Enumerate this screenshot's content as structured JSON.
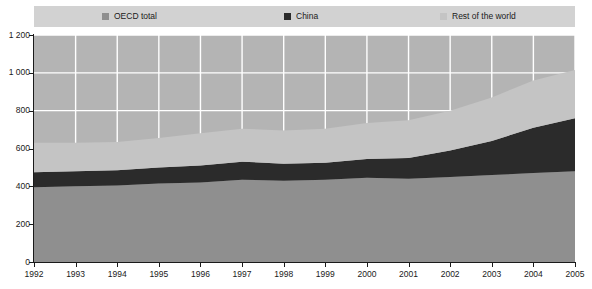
{
  "legend": {
    "position": "top",
    "items": [
      {
        "label": "OECD total",
        "color": "#8f8f8f",
        "key": "oecd"
      },
      {
        "label": "China",
        "color": "#2b2b2b",
        "key": "china"
      },
      {
        "label": "Rest of the world",
        "color": "#c4c4c4",
        "key": "row"
      }
    ]
  },
  "chart_data": {
    "type": "area",
    "stacked": true,
    "title": "",
    "xlabel": "",
    "ylabel": "",
    "grid": true,
    "plot_background": "#b4b4b4",
    "x": [
      1992,
      1993,
      1994,
      1995,
      1996,
      1997,
      1998,
      1999,
      2000,
      2001,
      2002,
      2003,
      2004,
      2005
    ],
    "xtick_labels": [
      "1992",
      "1993",
      "1994",
      "1995",
      "1996",
      "1997",
      "1998",
      "1999",
      "2000",
      "2001",
      "2002",
      "2003",
      "2004",
      "2005"
    ],
    "ytick_labels": [
      "0",
      "200",
      "400",
      "600",
      "800",
      "1 000",
      "1 200"
    ],
    "yticks": [
      0,
      200,
      400,
      600,
      800,
      1000,
      1200
    ],
    "ylim": [
      0,
      1200
    ],
    "xlim": [
      1992,
      2005
    ],
    "series": [
      {
        "name": "OECD total",
        "color": "#8f8f8f",
        "values": [
          395,
          400,
          405,
          415,
          420,
          435,
          430,
          435,
          445,
          440,
          450,
          460,
          470,
          480
        ]
      },
      {
        "name": "China",
        "color": "#2b2b2b",
        "values": [
          80,
          80,
          80,
          85,
          90,
          95,
          90,
          90,
          100,
          110,
          140,
          180,
          240,
          280
        ]
      },
      {
        "name": "Rest of the world",
        "color": "#c4c4c4",
        "values": [
          155,
          150,
          150,
          155,
          170,
          175,
          175,
          180,
          190,
          200,
          210,
          230,
          250,
          255
        ]
      }
    ],
    "totals": [
      630,
      630,
      635,
      655,
      680,
      705,
      695,
      705,
      735,
      750,
      800,
      870,
      960,
      1015
    ]
  }
}
